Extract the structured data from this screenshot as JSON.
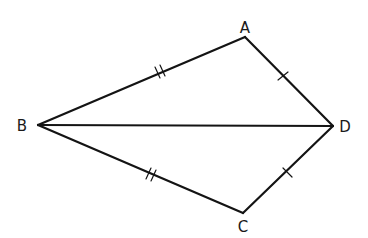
{
  "diagram": {
    "type": "geometry-kite",
    "vertices": {
      "A": {
        "label": "A",
        "x": 245,
        "y": 37
      },
      "B": {
        "label": "B",
        "x": 38,
        "y": 125
      },
      "C": {
        "label": "C",
        "x": 243,
        "y": 213
      },
      "D": {
        "label": "D",
        "x": 333,
        "y": 126
      }
    },
    "segments": [
      {
        "from": "B",
        "to": "A",
        "tick_marks": 2
      },
      {
        "from": "A",
        "to": "D",
        "tick_marks": 1
      },
      {
        "from": "B",
        "to": "C",
        "tick_marks": 2
      },
      {
        "from": "C",
        "to": "D",
        "tick_marks": 1
      },
      {
        "from": "B",
        "to": "D",
        "tick_marks": 0
      }
    ],
    "congruences": [
      "BA ≅ BC",
      "AD ≅ CD"
    ],
    "colors": {
      "stroke": "#141414",
      "background": "#ffffff",
      "text": "#1a1a1a"
    }
  }
}
